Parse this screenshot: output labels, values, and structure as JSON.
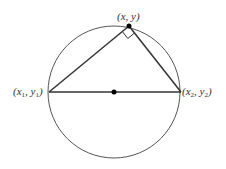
{
  "diagram": {
    "circle": {
      "cx": 114,
      "cy": 92,
      "r": 66
    },
    "points": {
      "top": {
        "label": "(x, y)",
        "x": 129,
        "y": 26
      },
      "left": {
        "label_parts": [
          "(x",
          "1",
          ", y",
          "1",
          ")"
        ],
        "x": 49,
        "y": 92
      },
      "right": {
        "label_parts": [
          "(x",
          "2",
          ", y",
          "2",
          ")"
        ],
        "x": 181,
        "y": 92
      },
      "center": {
        "x": 114,
        "y": 92
      }
    },
    "labels": {
      "top": "(x, y)",
      "left": "(x1, y1)",
      "right": "(x2, y2)"
    },
    "colors": {
      "stroke": "#333333",
      "circle": "#555555"
    }
  }
}
